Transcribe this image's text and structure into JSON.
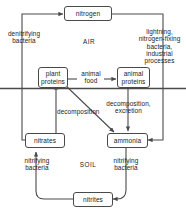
{
  "diagram": {
    "zones": [
      {
        "name": "air-zone-label",
        "label": "AIR"
      },
      {
        "name": "soil-zone-label",
        "label": "SOIL"
      }
    ],
    "nodes": [
      {
        "id": "nitrogen",
        "label": "nitrogen"
      },
      {
        "id": "plant-proteins",
        "label": "plant\nproteins"
      },
      {
        "id": "animal-proteins",
        "label": "animal\nproteins"
      },
      {
        "id": "nitrates",
        "label": "nitrates"
      },
      {
        "id": "ammonia",
        "label": "ammonia"
      },
      {
        "id": "nitrites",
        "label": "nitrites"
      }
    ],
    "edge_labels": [
      {
        "id": "denitrifying-bacteria",
        "label": "denitrifying\nbacteria"
      },
      {
        "id": "lightning-fixation",
        "label": "lightning,\nnitrogen-fixing\nbacteria,\nindustrial\nprocesses"
      },
      {
        "id": "animal-food",
        "label": "animal\nfood"
      },
      {
        "id": "decomposition",
        "label": "decomposition"
      },
      {
        "id": "decomposition-excretion",
        "label": "decomposition,\nexcretion"
      },
      {
        "id": "nitrifying-bacteria-left",
        "label": "nitrifying\nbacteria"
      },
      {
        "id": "nitrifying-bacteria-right",
        "label": "nitrifying\nbacteria"
      }
    ],
    "colors": {
      "line": "#4a4a4a",
      "text": "#222222",
      "background": "#ffffff"
    }
  }
}
